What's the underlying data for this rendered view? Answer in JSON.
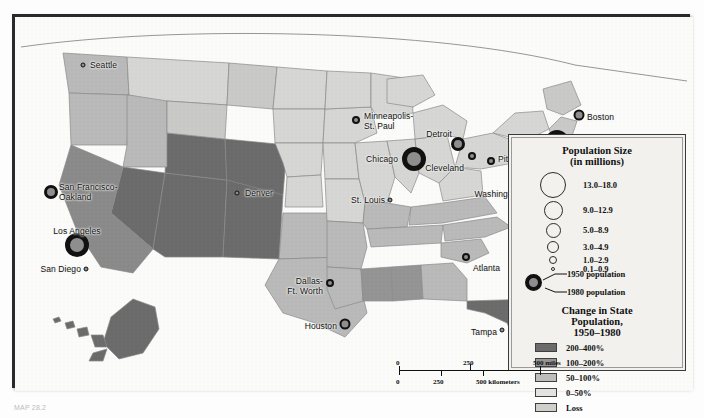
{
  "map": {
    "title": "United States Population Change 1950-1980",
    "colors": {
      "growth_200_400": "#6b6b6b",
      "growth_100_200": "#949494",
      "growth_50_100": "#b9b9b9",
      "growth_0_50": "#d6d6d4",
      "loss": "#c9c9c7",
      "water": "#fbfbfa",
      "frame": "#2a2a2a",
      "marker_ring": "#111111",
      "marker_fill": "#8e8e8e"
    },
    "cities": [
      {
        "name": "Seattle",
        "label": "Seattle",
        "x": 68,
        "y": 48,
        "size": "s1",
        "lx": 75,
        "ly": 44,
        "align": "left"
      },
      {
        "name": "San Francisco-Oakland",
        "label": "San Francisco-\nOakland",
        "x": 36,
        "y": 175,
        "size": "s4",
        "lx": 44,
        "ly": 166,
        "align": "left"
      },
      {
        "name": "Los Angeles",
        "label": "Los Angeles",
        "x": 62,
        "y": 228,
        "size": "s6",
        "lx": 62,
        "ly": 210,
        "align": "center"
      },
      {
        "name": "San Diego",
        "label": "San Diego",
        "x": 71,
        "y": 252,
        "size": "s1",
        "lx": 66,
        "ly": 248,
        "align": "right"
      },
      {
        "name": "Denver",
        "label": "Denver",
        "x": 222,
        "y": 176,
        "size": "s1",
        "lx": 230,
        "ly": 172,
        "align": "left"
      },
      {
        "name": "Minneapolis-St. Paul",
        "label": "Minneapolis-\nSt. Paul",
        "x": 341,
        "y": 103,
        "size": "s2",
        "lx": 349,
        "ly": 95,
        "align": "left"
      },
      {
        "name": "Chicago",
        "label": "Chicago",
        "x": 399,
        "y": 142,
        "size": "s6",
        "lx": 383,
        "ly": 138,
        "align": "right"
      },
      {
        "name": "Detroit",
        "label": "Detroit",
        "x": 443,
        "y": 127,
        "size": "s4",
        "lx": 437,
        "ly": 113,
        "align": "right"
      },
      {
        "name": "Cleveland",
        "label": "Cleveland",
        "x": 457,
        "y": 139,
        "size": "s2",
        "lx": 449,
        "ly": 147,
        "align": "right"
      },
      {
        "name": "St. Louis",
        "label": "St. Louis",
        "x": 375,
        "y": 183,
        "size": "s1",
        "lx": 370,
        "ly": 179,
        "align": "right"
      },
      {
        "name": "Pittsburgh",
        "label": "Pittsburgh",
        "x": 476,
        "y": 144,
        "size": "s2",
        "lx": 483,
        "ly": 138,
        "align": "left"
      },
      {
        "name": "New York",
        "label": "New York",
        "x": 542,
        "y": 125,
        "size": "s6",
        "lx": 557,
        "ly": 127,
        "align": "left"
      },
      {
        "name": "Boston",
        "label": "Boston",
        "x": 564,
        "y": 98,
        "size": "s3",
        "lx": 572,
        "ly": 96,
        "align": "left"
      },
      {
        "name": "Philadelphia",
        "label": "Philadelphia",
        "x": 528,
        "y": 144,
        "size": "s4",
        "lx": 535,
        "ly": 148,
        "align": "left"
      },
      {
        "name": "Baltimore",
        "label": "Baltimore",
        "x": 516,
        "y": 156,
        "size": "s2",
        "lx": 523,
        "ly": 160,
        "align": "left"
      },
      {
        "name": "Washington",
        "label": "Washington",
        "x": 513,
        "y": 169,
        "size": "s3",
        "lx": 505,
        "ly": 173,
        "align": "right"
      },
      {
        "name": "Dallas-Ft. Worth",
        "label": "Dallas-\nFt. Worth",
        "x": 315,
        "y": 266,
        "size": "s2",
        "lx": 308,
        "ly": 260,
        "align": "right"
      },
      {
        "name": "Houston",
        "label": "Houston",
        "x": 330,
        "y": 307,
        "size": "s3",
        "lx": 322,
        "ly": 305,
        "align": "right"
      },
      {
        "name": "Atlanta",
        "label": "Atlanta",
        "x": 451,
        "y": 240,
        "size": "s2",
        "lx": 458,
        "ly": 247,
        "align": "left"
      },
      {
        "name": "Tampa",
        "label": "Tampa",
        "x": 487,
        "y": 313,
        "size": "s1",
        "lx": 482,
        "ly": 311,
        "align": "right"
      },
      {
        "name": "Miami",
        "label": "Miami",
        "x": 520,
        "y": 334,
        "size": "s1",
        "lx": 527,
        "ly": 333,
        "align": "left"
      }
    ]
  },
  "legend": {
    "size_title_line1": "Population Size",
    "size_title_line2": "(in millions)",
    "size_classes": [
      {
        "label": "13.0–18.0",
        "d": 26
      },
      {
        "label": "9.0–12.9",
        "d": 19
      },
      {
        "label": "5.0–8.9",
        "d": 15
      },
      {
        "label": "3.0–4.9",
        "d": 12
      },
      {
        "label": "1.0–2.9",
        "d": 8
      },
      {
        "label": "0.1–0.9",
        "d": 4
      }
    ],
    "pop_1950_label": "1950 population",
    "pop_1980_label": "1980 population",
    "change_title_line1": "Change in State",
    "change_title_line2": "Population,",
    "change_title_line3": "1950–1980",
    "change_classes": [
      {
        "label": "200–400%",
        "color": "#6b6b6b"
      },
      {
        "label": "100–200%",
        "color": "#949494"
      },
      {
        "label": "50–100%",
        "color": "#bdbdbd"
      },
      {
        "label": "0–50%",
        "color": "#e2e2df"
      },
      {
        "label": "Loss",
        "color": "#cfcfcc"
      }
    ]
  },
  "scale": {
    "miles_ticks": [
      "0",
      "250",
      "500 miles"
    ],
    "km_ticks": [
      "0",
      "250",
      "500 kilometers"
    ]
  },
  "caption": {
    "text": "MAP 28.2"
  }
}
